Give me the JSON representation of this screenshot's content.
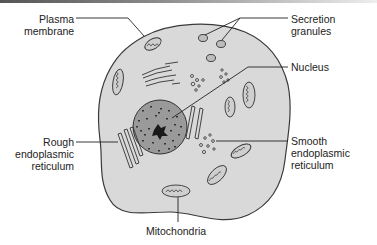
{
  "diagram": {
    "colors": {
      "cytoplasm": "#d9d9d9",
      "outline": "#3a3a3a",
      "nucleus": "#9a9a9a",
      "nucleolus": "#1a1a1a",
      "text": "#222222"
    },
    "labels": {
      "plasma_membrane": [
        "Plasma",
        "membrane"
      ],
      "secretion_granules": [
        "Secretion",
        "granules"
      ],
      "nucleus": [
        "Nucleus"
      ],
      "rough_er": [
        "Rough",
        "endoplasmic",
        "reticulum"
      ],
      "smooth_er": [
        "Smooth",
        "endoplasmic",
        "reticulum"
      ],
      "mitochondria": [
        "Mitochondria"
      ]
    }
  }
}
